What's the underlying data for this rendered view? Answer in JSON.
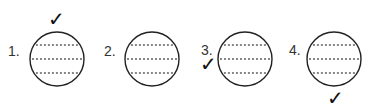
{
  "diagram": {
    "items": [
      {
        "label": "1.",
        "check": "✓",
        "check_position": "above",
        "label_pos": [
          8,
          44
        ],
        "circle": {
          "cx": 57,
          "cy": 59,
          "r": 27
        },
        "check_pos": [
          48,
          9
        ]
      },
      {
        "label": "2.",
        "check": "",
        "check_position": "none",
        "label_pos": [
          104,
          44
        ],
        "circle": {
          "cx": 152,
          "cy": 59,
          "r": 27
        },
        "check_pos": null
      },
      {
        "label": "3.",
        "check": "✓",
        "check_position": "left",
        "label_pos": [
          201,
          43
        ],
        "circle": {
          "cx": 245,
          "cy": 59,
          "r": 27
        },
        "check_pos": [
          200,
          54
        ]
      },
      {
        "label": "4.",
        "check": "✓",
        "check_position": "below",
        "label_pos": [
          289,
          43
        ],
        "circle": {
          "cx": 334,
          "cy": 59,
          "r": 27
        },
        "check_pos": [
          327,
          88
        ]
      }
    ],
    "colors": {
      "circle_stroke": "#222222",
      "dash_color": "#888888",
      "dash_accent": "#b06070"
    }
  }
}
